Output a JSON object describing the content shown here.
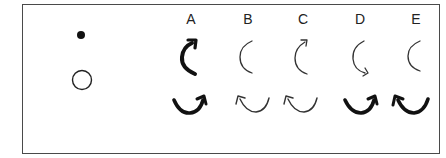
{
  "figure": {
    "legend_symbols": [
      {
        "name": "filled-dot",
        "cx": 81,
        "cy": 35,
        "r": 4,
        "fill": "#111111"
      },
      {
        "name": "open-circle",
        "cx": 82,
        "cy": 80,
        "r": 10,
        "stroke": "#222222"
      }
    ],
    "columns": [
      {
        "label": "A",
        "x": 191,
        "top_arrow": "thick-arc-arrow-top-right",
        "bottom_arrow": "thick-u-arrow-right"
      },
      {
        "label": "B",
        "x": 248,
        "top_arrow": "thin-arc-no-head",
        "bottom_arrow": "thin-u-arrow-left"
      },
      {
        "label": "C",
        "x": 303,
        "top_arrow": "thin-arc-arrow-top-right",
        "bottom_arrow": "thin-u-arrow-left"
      },
      {
        "label": "D",
        "x": 360,
        "top_arrow": "thin-arc-arrow-bottom-right",
        "bottom_arrow": "thick-u-arrow-right"
      },
      {
        "label": "E",
        "x": 416,
        "top_arrow": "thin-arc-no-head",
        "bottom_arrow": "thick-u-arrow-left"
      }
    ],
    "colors": {
      "frame": "#4a4a4a",
      "ink": "#111111",
      "thin_ink": "#333333"
    }
  }
}
